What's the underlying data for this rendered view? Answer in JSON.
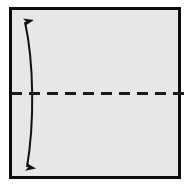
{
  "figure": {
    "title": "Folded sheet with horizontal fold line and vertical double arrow",
    "caption": "",
    "panel": {
      "name": "paper-sheet",
      "fill_color": "#e9e9e9",
      "border_color": "#0d0d0d",
      "border_width": 3,
      "x": 9,
      "y": 7,
      "width": 172,
      "height": 172,
      "texture": "faint-vertical-stripes"
    },
    "fold_line": {
      "name": "horizontal-dashed-fold-line",
      "orientation": "horizontal",
      "color": "#1a1a1a",
      "stroke_width": 3,
      "dash_length": 11,
      "gap_length": 7,
      "y": 93,
      "x_start": 11,
      "x_end": 190
    },
    "arrow": {
      "name": "vertical-double-headed-curved-arrow",
      "color": "#111111",
      "stroke_width": 2,
      "heads": "both",
      "head_top": {
        "x": 25,
        "y": 16
      },
      "head_bottom": {
        "x": 27,
        "y": 173
      },
      "bow_x": 34,
      "label": ""
    }
  }
}
